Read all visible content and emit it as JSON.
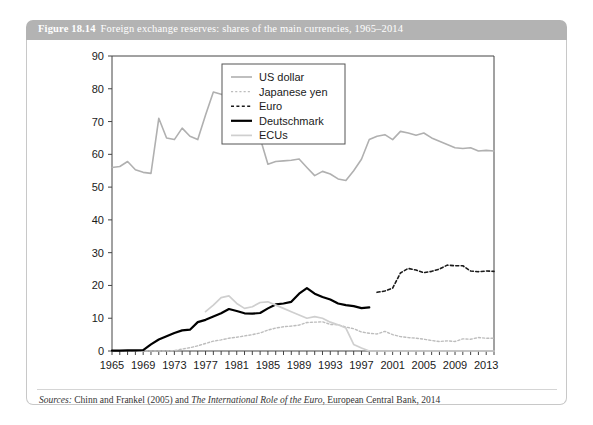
{
  "figure": {
    "number": "Figure 18.14",
    "title": "Foreign exchange reserves: shares of the main currencies, 1965–2014",
    "source_label": "Sources:",
    "source_text_1": " Chinn and Frankel (2005) and ",
    "source_title": "The International Role of the Euro",
    "source_text_2": ", European Central Bank, 2014",
    "header_bg": "#b3b3b3",
    "header_text_color": "#ffffff"
  },
  "chart_data": {
    "type": "line",
    "title": "Foreign exchange reserves: shares of the main currencies, 1965–2014",
    "xlabel": "",
    "ylabel": "",
    "xlim": [
      1965,
      2014
    ],
    "ylim": [
      0,
      90
    ],
    "ytick_step": 10,
    "xtick_step": 4,
    "grid": false,
    "legend_position": "top-center",
    "yticks": [
      "0",
      "10",
      "20",
      "30",
      "40",
      "50",
      "60",
      "70",
      "80",
      "90"
    ],
    "xticks": [
      "1965",
      "1969",
      "1973",
      "1977",
      "1981",
      "1985",
      "1989",
      "1993",
      "1997",
      "2001",
      "2005",
      "2009",
      "2013"
    ],
    "x": [
      1965,
      1966,
      1967,
      1968,
      1969,
      1970,
      1971,
      1972,
      1973,
      1974,
      1975,
      1976,
      1977,
      1978,
      1979,
      1980,
      1981,
      1982,
      1983,
      1984,
      1985,
      1986,
      1987,
      1988,
      1989,
      1990,
      1991,
      1992,
      1993,
      1994,
      1995,
      1996,
      1997,
      1998,
      1999,
      2000,
      2001,
      2002,
      2003,
      2004,
      2005,
      2006,
      2007,
      2008,
      2009,
      2010,
      2011,
      2012,
      2013,
      2014
    ],
    "series": [
      {
        "name": "US dollar",
        "color": "#b0b0b0",
        "style": "solid",
        "width": 1.6,
        "values": [
          56.0,
          56.3,
          57.8,
          55.3,
          54.5,
          54.2,
          71.0,
          65.0,
          64.5,
          68.0,
          65.5,
          64.5,
          72.0,
          79.0,
          78.3,
          78.5,
          79.2,
          78.5,
          74.0,
          65.0,
          57.0,
          57.8,
          58.0,
          58.2,
          58.6,
          56.0,
          53.5,
          54.8,
          54.0,
          52.5,
          52.0,
          55.0,
          58.5,
          64.5,
          65.5,
          66.0,
          64.5,
          67.0,
          66.5,
          65.8,
          66.5,
          65.0,
          64.0,
          63.0,
          62.0,
          61.8,
          62.0,
          61.0,
          61.2,
          61.0
        ]
      },
      {
        "name": "Japanese yen",
        "color": "#bdbdbd",
        "style": "dotted",
        "width": 1.4,
        "values": [
          0.0,
          0.0,
          0.0,
          0.0,
          0.0,
          0.0,
          0.0,
          0.0,
          0.1,
          0.6,
          1.0,
          1.6,
          2.3,
          3.0,
          3.4,
          3.9,
          4.2,
          4.6,
          5.0,
          5.5,
          6.4,
          7.0,
          7.4,
          7.6,
          7.9,
          8.7,
          8.8,
          8.9,
          8.1,
          8.0,
          7.3,
          6.8,
          5.8,
          5.4,
          5.2,
          6.0,
          5.0,
          4.4,
          4.1,
          3.9,
          3.6,
          3.2,
          2.9,
          3.1,
          2.9,
          3.7,
          3.6,
          4.1,
          3.9,
          3.9
        ]
      },
      {
        "name": "Euro",
        "color": "#1a1a1a",
        "style": "dashed",
        "width": 1.6,
        "values": [
          null,
          null,
          null,
          null,
          null,
          null,
          null,
          null,
          null,
          null,
          null,
          null,
          null,
          null,
          null,
          null,
          null,
          null,
          null,
          null,
          null,
          null,
          null,
          null,
          null,
          null,
          null,
          null,
          null,
          null,
          null,
          null,
          null,
          null,
          17.9,
          18.3,
          19.2,
          23.8,
          25.2,
          24.7,
          23.9,
          24.3,
          25.0,
          26.2,
          26.0,
          26.0,
          24.4,
          24.2,
          24.4,
          24.3
        ]
      },
      {
        "name": "Deutschmark",
        "color": "#000000",
        "style": "solid",
        "width": 2.2,
        "values": [
          0.1,
          0.1,
          0.2,
          0.2,
          0.3,
          2.0,
          3.5,
          4.5,
          5.5,
          6.3,
          6.5,
          8.8,
          9.5,
          10.5,
          11.5,
          12.8,
          12.2,
          11.5,
          11.4,
          11.6,
          13.0,
          14.2,
          14.5,
          15.0,
          17.5,
          19.2,
          17.5,
          16.5,
          15.7,
          14.5,
          14.0,
          13.7,
          13.1,
          13.3,
          null,
          null,
          null,
          null,
          null,
          null,
          null,
          null,
          null,
          null,
          null,
          null,
          null,
          null,
          null,
          null
        ]
      },
      {
        "name": "ECUs",
        "color": "#cfcfcf",
        "style": "solid",
        "width": 1.7,
        "values": [
          null,
          null,
          null,
          null,
          null,
          null,
          null,
          null,
          null,
          null,
          null,
          null,
          12.0,
          14.0,
          16.3,
          16.8,
          14.5,
          13.0,
          13.5,
          14.8,
          15.0,
          14.0,
          13.0,
          12.0,
          11.0,
          10.0,
          10.5,
          10.0,
          8.8,
          8.0,
          7.0,
          2.0,
          0.9,
          0.0,
          0.0,
          0.0,
          0.0,
          0.0,
          0.0,
          0.0,
          0.0,
          0.0,
          0.0,
          0.0,
          0.0,
          0.0,
          0.0,
          0.0,
          0.0,
          0.0
        ]
      }
    ]
  },
  "legend": {
    "items": [
      {
        "label": "US dollar"
      },
      {
        "label": "Japanese yen"
      },
      {
        "label": "Euro"
      },
      {
        "label": "Deutschmark"
      },
      {
        "label": "ECUs"
      }
    ]
  }
}
